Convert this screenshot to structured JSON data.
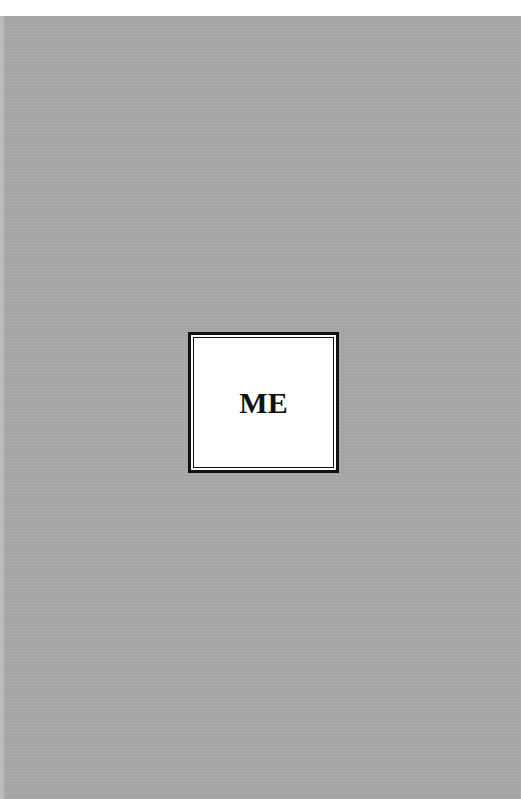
{
  "cover": {
    "title": "ME",
    "colors": {
      "background": "#a9a9a9",
      "box_fill": "#ffffff",
      "box_border": "#111111",
      "text": "#111111"
    }
  }
}
